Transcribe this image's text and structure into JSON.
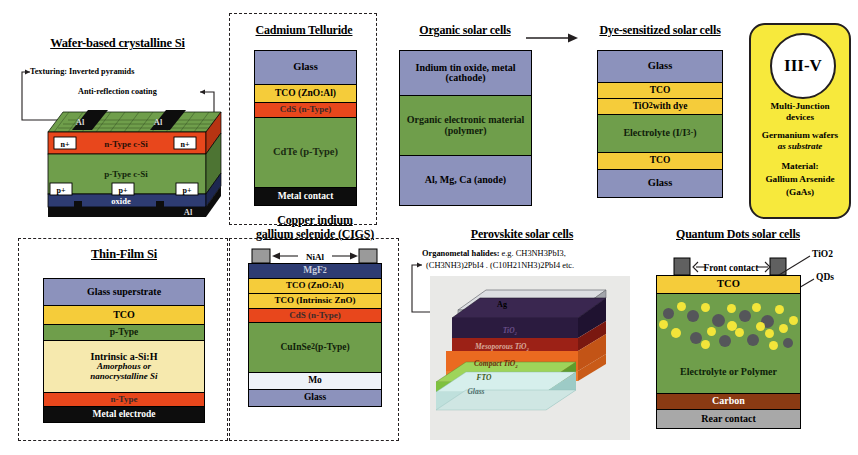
{
  "figure": {
    "colors": {
      "glass": "#8c92bc",
      "tco_yellow": "#f5cc3a",
      "cds_red": "#e8471c",
      "absorber_green": "#6f9e4b",
      "intrinsic_cream": "#f6e9ae",
      "black": "#0d0d0d",
      "mgf2_navy": "#2e3c72",
      "mo_light": "#eef2f8",
      "carbon_brown": "#8a3a13",
      "rear_gray": "#a8a8a8",
      "qd_yellow": "#f2e53a",
      "qd_dark": "#55565a",
      "iii_v_yellow": "#f7e93c",
      "ag_gray": "#c9cbcf",
      "spiro_purple": "#2b1b3f",
      "perovskite_red": "#9c2116",
      "meso_orange": "#ea6a20",
      "fto_green": "#7ec13f",
      "pv_glass": "#bfe0dc"
    }
  },
  "panels": {
    "wafer": {
      "title": "Wafer-based crystalline Si",
      "annotations": {
        "texturing_label": "Texturing:",
        "texturing_value": "Inverted pyramids",
        "arc": "Anti-reflection coating"
      },
      "layers": {
        "al_left": "Al",
        "al_right": "Al",
        "n_plus_left": "n+",
        "n_plus_right": "n+",
        "n_type": "n-Type c-Si",
        "p_type": "p-Type c-Si",
        "p_plus_left": "p+",
        "p_plus_mid": "p+",
        "p_plus_right": "p+",
        "oxide": "oxide",
        "al_bottom": "Al"
      }
    },
    "cdte": {
      "title": "Cadmium Telluride",
      "layers": [
        {
          "label": "Glass",
          "color": "#8c92bc",
          "h": 34,
          "fs": 10.5,
          "tc": "#000"
        },
        {
          "label": "TCO (ZnO:Al)",
          "color": "#f5cc3a",
          "h": 18,
          "fs": 9.5,
          "tc": "#000"
        },
        {
          "label": "CdS (n-Type)",
          "color": "#e8471c",
          "h": 15,
          "fs": 9,
          "tc": "#3b2a2a"
        },
        {
          "label": "CdTe (p-Type)",
          "color": "#6f9e4b",
          "h": 70,
          "fs": 10.5,
          "tc": "#1a2a12"
        },
        {
          "label": "Metal contact",
          "color": "#0d0d0d",
          "h": 17,
          "fs": 9.5,
          "tc": "#ffffff"
        }
      ]
    },
    "organic": {
      "title": "Organic solar cells",
      "layers": [
        {
          "label": "Indium tin oxide, metal (cathode)",
          "color": "#8c92bc",
          "h": 45,
          "fs": 10,
          "tc": "#000"
        },
        {
          "label": "Organic electronic material (polymer)",
          "color": "#6f9e4b",
          "h": 60,
          "fs": 10,
          "tc": "#10200a"
        },
        {
          "label": "Al, Mg, Ca (anode)",
          "color": "#8c92bc",
          "h": 49,
          "fs": 10,
          "tc": "#000"
        }
      ]
    },
    "dssc": {
      "title": "Dye-sensitized solar cells",
      "layers": [
        {
          "label": "Glass",
          "color": "#8c92bc",
          "h": 32,
          "fs": 10.5,
          "tc": "#000"
        },
        {
          "label": "TCO",
          "color": "#f5cc3a",
          "h": 16,
          "fs": 9.5,
          "tc": "#000"
        },
        {
          "label": "TiO2 with dye",
          "color": "#f5cc3a",
          "h": 16,
          "fs": 9.5,
          "tc": "#000"
        },
        {
          "label": "Electrolyte (I/I3-)",
          "color": "#6f9e4b",
          "h": 38,
          "fs": 10,
          "tc": "#10200a"
        },
        {
          "label": "TCO",
          "color": "#f5cc3a",
          "h": 17,
          "fs": 9.5,
          "tc": "#000"
        },
        {
          "label": "Glass",
          "color": "#8c92bc",
          "h": 27,
          "fs": 10.5,
          "tc": "#000"
        }
      ]
    },
    "iii_v": {
      "badge": "III-V",
      "lines": [
        "Multi-Junction",
        "devices",
        "Germanium wafers",
        "as substrate",
        "Material:",
        "Gallium Arsenide",
        "(GaAs)"
      ]
    },
    "thinfilm": {
      "title": "Thin-Film Si",
      "layers": [
        {
          "label": "Glass superstrate",
          "color": "#8c92bc",
          "h": 27,
          "fs": 10,
          "tc": "#000"
        },
        {
          "label": "TCO",
          "color": "#f5cc3a",
          "h": 19,
          "fs": 10,
          "tc": "#000"
        },
        {
          "label": "p-Type",
          "color": "#6f9e4b",
          "h": 16,
          "fs": 9.5,
          "tc": "#0f1f08"
        },
        {
          "label": "Intrinsic a-Si:H",
          "color": "#f6e9ae",
          "h": 52,
          "fs": 10,
          "tc": "#000"
        },
        {
          "label": "n-Type",
          "color": "#e8471c",
          "h": 14,
          "fs": 9,
          "tc": "#3b2a2a"
        },
        {
          "label": "Metal electrode",
          "color": "#0d0d0d",
          "h": 15,
          "fs": 9.5,
          "tc": "#ffffff"
        }
      ],
      "sub_italic_1": "Amorphous or",
      "sub_italic_2": "nanocrystalline Si"
    },
    "cigs": {
      "title_line1": "Copper indium",
      "title_line2": "gallium selenide (CIGS)",
      "contact_label": "NiAl",
      "layers": [
        {
          "label": "MgF2",
          "color": "#2e3c72",
          "h": 15,
          "fs": 9.5,
          "tc": "#c9cede"
        },
        {
          "label": "TCO (ZnO:Al)",
          "color": "#f5cc3a",
          "h": 15,
          "fs": 9,
          "tc": "#000"
        },
        {
          "label": "TCO (Intrinsic ZnO)",
          "color": "#f5cc3a",
          "h": 15,
          "fs": 9,
          "tc": "#000"
        },
        {
          "label": "CdS (n-Type)",
          "color": "#e8471c",
          "h": 14,
          "fs": 9,
          "tc": "#3b2a2a"
        },
        {
          "label": "CuInSe2 (p-Type)",
          "color": "#6f9e4b",
          "h": 50,
          "fs": 9.5,
          "tc": "#10200a"
        },
        {
          "label": "Mo",
          "color": "#eef2f8",
          "h": 17,
          "fs": 9.5,
          "tc": "#000"
        },
        {
          "label": "Glass",
          "color": "#8c92bc",
          "h": 16,
          "fs": 9.5,
          "tc": "#000"
        }
      ]
    },
    "perovskite": {
      "title": "Perovskite solar cells",
      "formula_line1_bold": "Organometal halides:",
      "formula_line1_rest": "e.g. CH3NH3PbI3,",
      "formula_line2": "(CH3NH3)2PbI4 . (C10H21NH3)2PbI4 etc.",
      "stack_labels": [
        "Ag",
        "TiO2",
        "Mesoporous TiO2",
        "Compact TiO2",
        "FTO",
        "Glass"
      ]
    },
    "qd": {
      "title": "Quantum Dots solar cells",
      "callouts": {
        "front_contact": "Front contact",
        "tio2": "TiO2",
        "qds": "QDs"
      },
      "layers": [
        {
          "label": "TCO",
          "color": "#f5cc3a",
          "h": 18,
          "fs": 10.5,
          "tc": "#000"
        },
        {
          "label": "",
          "color": "#6f9e4b",
          "h": 58,
          "fs": 10,
          "tc": "#000"
        },
        {
          "label": "Electrolyte or Polymer",
          "color": "#6f9e4b",
          "h": 42,
          "fs": 10,
          "tc": "#0d1f08"
        },
        {
          "label": "Carbon",
          "color": "#8a3a13",
          "h": 16,
          "fs": 10,
          "tc": "#ffffff"
        },
        {
          "label": "Rear contact",
          "color": "#a8a8a8",
          "h": 18,
          "fs": 10,
          "tc": "#000"
        }
      ]
    }
  }
}
